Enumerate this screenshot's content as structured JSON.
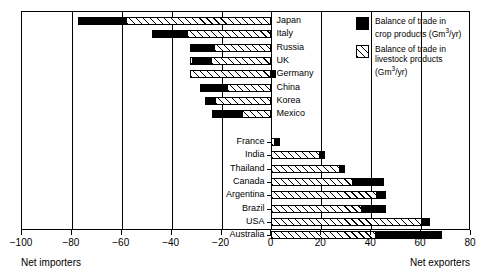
{
  "chart_data": {
    "type": "bar",
    "orientation": "horizontal",
    "title": "",
    "xlabel": "",
    "ylabel": "",
    "xlim": [
      -100,
      80
    ],
    "xticks": [
      -100,
      -80,
      -60,
      -40,
      -20,
      0,
      20,
      40,
      60,
      80
    ],
    "xtick_labels": [
      "−100",
      "−80",
      "−60",
      "−40",
      "−20",
      "0",
      "20",
      "40",
      "60",
      "80"
    ],
    "grid": true,
    "grid_axis": "x",
    "stacked": true,
    "units": "Gm3/yr",
    "axis_captions": {
      "left": "Net importers",
      "right": "Net exporters"
    },
    "legend": {
      "position": "top-right",
      "entries": [
        {
          "key": "crop",
          "label_line1": "Balance of trade in",
          "label_line2": "crop products (Gm",
          "label_sup": "3",
          "label_line3": "/yr)",
          "swatch": "solid-black"
        },
        {
          "key": "livestock",
          "label_line1": "Balance of trade in",
          "label_line2": "livestock products",
          "label_line3": "(Gm",
          "label_sup": "3",
          "label_line4": "/yr)",
          "swatch": "diagonal-hatch"
        }
      ]
    },
    "groups": [
      {
        "name": "importers",
        "label_side": "right",
        "categories": [
          "Japan",
          "Italy",
          "Russia",
          "UK",
          "Germany",
          "China",
          "Korea",
          "Mexico"
        ],
        "series": [
          {
            "name": "Balance of trade in crop products (Gm3/yr)",
            "key": "crop",
            "values": [
              -19.0,
              -14.0,
              -9.5,
              -8.0,
              1.5,
              -10.5,
              -4.0,
              -12.5
            ]
          },
          {
            "name": "Balance of trade in livestock products (Gm3/yr)",
            "key": "livestock",
            "values": [
              -58.5,
              -34.0,
              -23.0,
              -24.0,
              -32.5,
              -18.0,
              -22.5,
              -11.5
            ]
          }
        ]
      },
      {
        "name": "exporters",
        "label_side": "left",
        "categories": [
          "France",
          "India",
          "Thailand",
          "Canada",
          "Argentina",
          "Brazil",
          "USA",
          "Australia"
        ],
        "series": [
          {
            "name": "Balance of trade in crop products (Gm3/yr)",
            "key": "crop",
            "values": [
              2.0,
              2.0,
              2.0,
              12.5,
              3.5,
              9.5,
              3.0,
              26.5
            ]
          },
          {
            "name": "Balance of trade in livestock products (Gm3/yr)",
            "key": "livestock",
            "values": [
              1.5,
              19.5,
              27.5,
              32.5,
              42.5,
              36.5,
              60.5,
              42.0
            ]
          }
        ]
      }
    ],
    "bars": [
      {
        "category": "Japan",
        "crop_start": -77.5,
        "crop_end": -58.5,
        "livestock_start": -58.5,
        "livestock_end": 0,
        "total": -77.5
      },
      {
        "category": "Italy",
        "crop_start": -48.0,
        "crop_end": -34.0,
        "livestock_start": -34.0,
        "livestock_end": 0,
        "total": -48.0
      },
      {
        "category": "Russia",
        "crop_start": -32.5,
        "crop_end": -23.0,
        "livestock_start": -23.0,
        "livestock_end": 0,
        "total": -32.5
      },
      {
        "category": "UK",
        "crop_start": -32.0,
        "crop_end": -24.0,
        "livestock_start": -32.5,
        "livestock_end": 0,
        "total": -32.5
      },
      {
        "category": "Germany",
        "crop_start": 0.0,
        "crop_end": 2.0,
        "livestock_start": -32.5,
        "livestock_end": 0,
        "total": -32.5
      },
      {
        "category": "China",
        "crop_start": -28.5,
        "crop_end": -18.0,
        "livestock_start": -18.0,
        "livestock_end": 0,
        "total": -28.5
      },
      {
        "category": "Korea",
        "crop_start": -26.5,
        "crop_end": -22.5,
        "livestock_start": -22.5,
        "livestock_end": 0,
        "total": -26.5
      },
      {
        "category": "Mexico",
        "crop_start": -24.0,
        "crop_end": -11.5,
        "livestock_start": -15.5,
        "livestock_end": 0,
        "total": -24.0
      },
      {
        "category": "France",
        "crop_start": 1.5,
        "crop_end": 3.5,
        "livestock_start": 0,
        "livestock_end": 1.5,
        "total": 3.5
      },
      {
        "category": "India",
        "crop_start": 19.5,
        "crop_end": 21.5,
        "livestock_start": 0,
        "livestock_end": 19.5,
        "total": 21.5
      },
      {
        "category": "Thailand",
        "crop_start": 27.5,
        "crop_end": 29.5,
        "livestock_start": 0,
        "livestock_end": 27.5,
        "total": 29.5
      },
      {
        "category": "Canada",
        "crop_start": 32.5,
        "crop_end": 45.0,
        "livestock_start": 0,
        "livestock_end": 32.5,
        "total": 45.0
      },
      {
        "category": "Argentina",
        "crop_start": 42.5,
        "crop_end": 46.0,
        "livestock_start": 0,
        "livestock_end": 42.5,
        "total": 46.0
      },
      {
        "category": "Brazil",
        "crop_start": 36.5,
        "crop_end": 46.0,
        "livestock_start": 0,
        "livestock_end": 36.5,
        "total": 46.0
      },
      {
        "category": "USA",
        "crop_start": 60.5,
        "crop_end": 63.5,
        "livestock_start": 0,
        "livestock_end": 60.5,
        "total": 63.5
      },
      {
        "category": "Australia",
        "crop_start": 42.0,
        "crop_end": 68.5,
        "livestock_start": 0,
        "livestock_end": 42.0,
        "total": 68.5
      }
    ]
  }
}
